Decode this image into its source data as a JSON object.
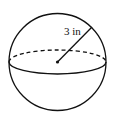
{
  "figure": {
    "shape": "sphere",
    "radius_label": "3 in",
    "radius_value": 3,
    "radius_unit": "in",
    "stroke_color": "#111111",
    "background_color": "#ffffff"
  }
}
